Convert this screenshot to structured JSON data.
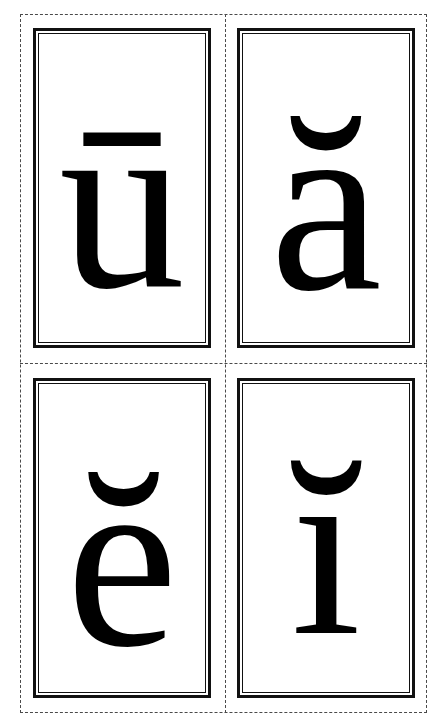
{
  "sheet": {
    "title": "Vowel Flashcards",
    "background_color": "#ffffff",
    "width": 447,
    "height": 727,
    "layout": "2x2-grid"
  },
  "cut_guides": {
    "style": "dashed",
    "color": "#4a4a4a",
    "outer_label": "cut-border",
    "vertical_label": "cut-line-vertical",
    "horizontal_label": "cut-line-horizontal"
  },
  "card_style": {
    "outer_border_color": "#111111",
    "inner_border_color": "#111111",
    "face_color": "#ffffff",
    "glyph_color": "#000000"
  },
  "cards": [
    {
      "id": "card-u",
      "glyph": "ū",
      "letter": "u",
      "diacritic": "macron",
      "position": "top-left"
    },
    {
      "id": "card-a",
      "glyph": "ă",
      "letter": "a",
      "diacritic": "breve",
      "position": "top-right"
    },
    {
      "id": "card-e",
      "glyph": "ĕ",
      "letter": "e",
      "diacritic": "breve",
      "position": "bottom-left"
    },
    {
      "id": "card-i",
      "glyph": "ĭ",
      "letter": "i",
      "diacritic": "breve",
      "position": "bottom-right"
    }
  ]
}
